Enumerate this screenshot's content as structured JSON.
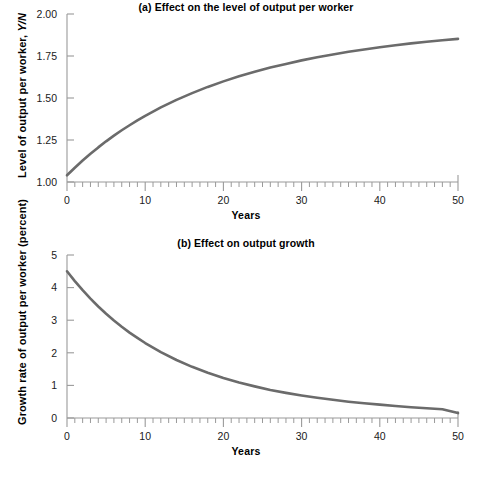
{
  "figure": {
    "background": "#ffffff",
    "line_color": "#6b6b6b",
    "axis_color": "#9a9a9a",
    "text_color": "#1a1a1a"
  },
  "panel_a": {
    "title": "(a) Effect on the level of output per worker",
    "ylabel_main": "Level of output per worker, ",
    "ylabel_italic": "Y/N",
    "xlabel": "Years",
    "ytick_labels": [
      "1.00",
      "1.25",
      "1.50",
      "1.75",
      "2.00"
    ],
    "xtick_labels": [
      "0",
      "10",
      "20",
      "30",
      "40",
      "50"
    ]
  },
  "panel_b": {
    "title": "(b) Effect on output growth",
    "ylabel": "Growth rate of output per worker (percent)",
    "xlabel": "Years",
    "ytick_labels": [
      "0",
      "1",
      "2",
      "3",
      "4",
      "5"
    ],
    "xtick_labels": [
      "0",
      "10",
      "20",
      "30",
      "40",
      "50"
    ]
  },
  "chart_data": [
    {
      "type": "line",
      "title": "(a) Effect on the level of output per worker",
      "xlabel": "Years",
      "ylabel": "Level of output per worker, Y/N",
      "xlim": [
        0,
        50
      ],
      "ylim": [
        1.0,
        2.0
      ],
      "yticks": [
        1.0,
        1.25,
        1.5,
        1.75,
        2.0
      ],
      "xticks": [
        0,
        10,
        20,
        30,
        40,
        50
      ],
      "xminor_step": 1,
      "grid": false,
      "legend": "none",
      "series": [
        {
          "name": "Level of output per worker",
          "x": [
            0,
            1,
            2,
            3,
            4,
            5,
            6,
            7,
            8,
            9,
            10,
            12,
            14,
            16,
            18,
            20,
            22,
            24,
            26,
            28,
            30,
            32,
            34,
            36,
            38,
            40,
            42,
            44,
            46,
            48,
            50
          ],
          "values": [
            1.04,
            1.085,
            1.128,
            1.168,
            1.206,
            1.242,
            1.276,
            1.308,
            1.338,
            1.367,
            1.394,
            1.444,
            1.489,
            1.529,
            1.566,
            1.599,
            1.629,
            1.656,
            1.681,
            1.703,
            1.724,
            1.742,
            1.759,
            1.775,
            1.789,
            1.802,
            1.814,
            1.825,
            1.835,
            1.844,
            1.852
          ]
        }
      ]
    },
    {
      "type": "line",
      "title": "(b) Effect on output growth",
      "xlabel": "Years",
      "ylabel": "Growth rate of output per worker (percent)",
      "xlim": [
        0,
        50
      ],
      "ylim": [
        0,
        5
      ],
      "yticks": [
        0,
        1,
        2,
        3,
        4,
        5
      ],
      "xticks": [
        0,
        10,
        20,
        30,
        40,
        50
      ],
      "xminor_step": 1,
      "grid": false,
      "legend": "none",
      "series": [
        {
          "name": "Growth rate of output per worker",
          "x": [
            0,
            1,
            2,
            3,
            4,
            5,
            6,
            7,
            8,
            9,
            10,
            12,
            14,
            16,
            18,
            20,
            22,
            24,
            26,
            28,
            30,
            32,
            34,
            36,
            38,
            40,
            42,
            44,
            46,
            48,
            50
          ],
          "values": [
            4.5,
            4.2,
            3.92,
            3.66,
            3.42,
            3.2,
            2.99,
            2.8,
            2.62,
            2.46,
            2.3,
            2.02,
            1.78,
            1.57,
            1.39,
            1.23,
            1.09,
            0.97,
            0.86,
            0.77,
            0.69,
            0.62,
            0.56,
            0.5,
            0.45,
            0.41,
            0.37,
            0.33,
            0.3,
            0.27,
            0.15
          ]
        }
      ]
    }
  ]
}
